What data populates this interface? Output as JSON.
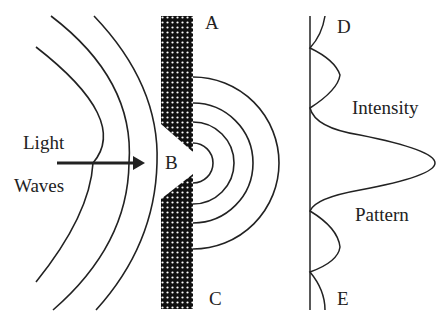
{
  "labels": {
    "light": "Light",
    "waves": "Waves",
    "a": "A",
    "b": "B",
    "c": "C",
    "d": "D",
    "e": "E",
    "intensity": "Intensity",
    "pattern": "Pattern"
  },
  "colors": {
    "ink": "#222222",
    "barrier": "#111111",
    "background": "#ffffff"
  }
}
